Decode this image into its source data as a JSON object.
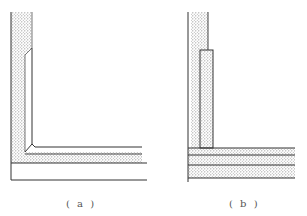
{
  "figure": {
    "panels": [
      {
        "id": "a",
        "caption": "( a )",
        "description": "Corner liner with chamfered inner joint over dotted lining layer"
      },
      {
        "id": "b",
        "caption": "( b )",
        "description": "Corner with inserted vertical block over layered dotted horizontal bands"
      }
    ],
    "colors": {
      "line": "#333333",
      "fill_dots": "#9a9a9a",
      "background": "#ffffff"
    }
  }
}
